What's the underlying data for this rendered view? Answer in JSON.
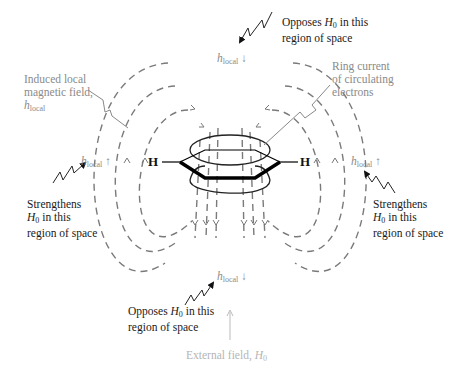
{
  "diagram": {
    "labels": {
      "opposes_top": {
        "line1_pre": "Opposes ",
        "H": "H",
        "sub": "0",
        "line1_post": " in this",
        "line2": "region of space"
      },
      "opposes_bottom": {
        "line1_pre": "Opposes ",
        "H": "H",
        "sub": "0",
        "line1_post": " in this",
        "line2": "region of space"
      },
      "strengthens_left": {
        "line1": "Strengthens",
        "H": "H",
        "sub": "0",
        "line2_post": " in this",
        "line3": "region of space"
      },
      "strengthens_right": {
        "line1": "Strengthens",
        "H": "H",
        "sub": "0",
        "line2_post": " in this",
        "line3": "region of space"
      },
      "induced": {
        "line1": "Induced local",
        "line2": "magnetic field,",
        "h": "h",
        "sub": "local"
      },
      "ring_current": {
        "line1": "Ring current",
        "line2": "of circulating",
        "line3": "electrons"
      },
      "external": {
        "text": "External field, ",
        "H": "H",
        "sub": "0"
      }
    },
    "h_local": {
      "h": "h",
      "sub": "local",
      "up": "↑",
      "down": "↓"
    },
    "atoms": {
      "left": "H",
      "right": "H"
    },
    "colors": {
      "field_lines": "#7a7a7a",
      "text_gray": "#8a8a8a",
      "text_dark": "#1a1a1a",
      "bond": "#000000"
    }
  }
}
